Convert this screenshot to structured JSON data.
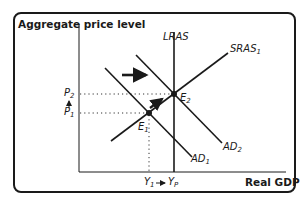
{
  "diagram": {
    "type": "AD-AS model",
    "y_axis_label": "Aggregate price level",
    "x_axis_label": "Real GDP",
    "curves": [
      {
        "id": "LRAS",
        "label": "LRAS",
        "orientation": "vertical"
      },
      {
        "id": "SRAS1",
        "label": "SRAS",
        "subscript": "1",
        "slope": "upward"
      },
      {
        "id": "AD1",
        "label": "AD",
        "subscript": "1",
        "slope": "downward"
      },
      {
        "id": "AD2",
        "label": "AD",
        "subscript": "2",
        "slope": "downward"
      }
    ],
    "points": [
      {
        "id": "E1",
        "label": "E",
        "subscript": "1"
      },
      {
        "id": "E2",
        "label": "E",
        "subscript": "2"
      }
    ],
    "y_ticks": [
      {
        "label": "P",
        "subscript": "2"
      },
      {
        "label": "P",
        "subscript": "1"
      }
    ],
    "x_ticks": [
      {
        "label": "Y",
        "subscript": "1"
      },
      {
        "label": "Y",
        "subscript": "P"
      }
    ],
    "annotations": [
      "Horizontal arrow: AD shifts right from AD1 to AD2",
      "Arrow along SRAS1 from E1 to E2",
      "Arrow from P1 up to P2",
      "Arrow from Y1 to YP"
    ],
    "colors": {
      "line": "#1a1a1a",
      "background": "#ffffff"
    }
  }
}
